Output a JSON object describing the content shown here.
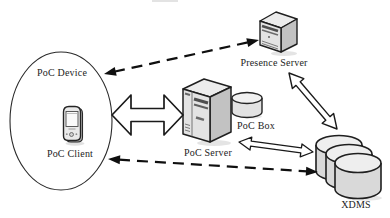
{
  "diagram": {
    "type": "architecture-diagram",
    "topic": "PoC (Push-to-talk over Cellular) architecture",
    "nodes": {
      "poc_device": {
        "label": "PoC Device",
        "shape": "ellipse-boundary"
      },
      "poc_client": {
        "label": "PoC Client",
        "icon": "pda-phone-icon"
      },
      "poc_server": {
        "label": "PoC Server",
        "icon": "tower-server-icon"
      },
      "poc_box": {
        "label": "PoC Box",
        "icon": "database-cylinder-icon"
      },
      "presence_server": {
        "label": "Presence Server",
        "icon": "tower-server-icon"
      },
      "xdms": {
        "label": "XDMS",
        "icon": "stacked-databases-icon"
      }
    },
    "edges": [
      {
        "from": "poc_device",
        "to": "presence_server",
        "style": "dashed-line",
        "arrowheads": "both"
      },
      {
        "from": "poc_device",
        "to": "poc_server",
        "style": "open-block-arrow",
        "arrowheads": "both"
      },
      {
        "from": "presence_server",
        "to": "xdms",
        "style": "open-block-arrow",
        "arrowheads": "both"
      },
      {
        "from": "poc_server",
        "to": "xdms",
        "style": "open-block-arrow",
        "arrowheads": "both"
      },
      {
        "from": "poc_client",
        "to": "xdms",
        "style": "dashed-line",
        "arrowheads": "both"
      }
    ],
    "colors": {
      "background": "#ffffff",
      "outline": "#1f1f1f",
      "fill_light": "#efefef",
      "fill_mid": "#d9d9d9",
      "fill_dark": "#b5b5b5",
      "text": "#1c1c1c"
    }
  }
}
